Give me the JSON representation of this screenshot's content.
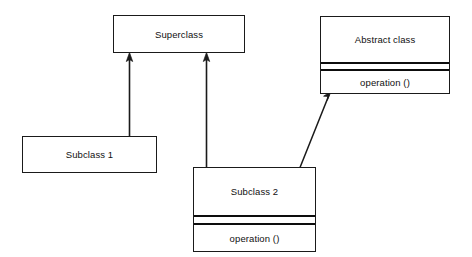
{
  "diagram": {
    "background_color": "#ffffff",
    "line_color": "#1a1a1a",
    "text_color": "#101010",
    "classes": [
      {
        "id": "superclass",
        "name": "Superclass",
        "compartments": [
          "Superclass"
        ],
        "has_attribute_compartment": false,
        "has_operation_compartment": false,
        "operations": [],
        "box": {
          "x": 113,
          "y": 15,
          "width": 132,
          "height": 38
        }
      },
      {
        "id": "abstract-class",
        "name": "Abstract class",
        "compartments": [
          "Abstract class",
          "",
          "operation ()"
        ],
        "has_attribute_compartment": true,
        "has_operation_compartment": true,
        "operations": [
          "operation ()"
        ],
        "box": {
          "x": 320,
          "y": 16,
          "width": 130,
          "height": 78
        }
      },
      {
        "id": "subclass-1",
        "name": "Subclass 1",
        "compartments": [
          "Subclass 1"
        ],
        "has_attribute_compartment": false,
        "has_operation_compartment": false,
        "operations": [],
        "box": {
          "x": 22,
          "y": 136,
          "width": 135,
          "height": 37
        }
      },
      {
        "id": "subclass-2",
        "name": "Subclass 2",
        "compartments": [
          "Subclass 2",
          "",
          "operation ()"
        ],
        "has_attribute_compartment": true,
        "has_operation_compartment": true,
        "operations": [
          "operation ()"
        ],
        "box": {
          "x": 193,
          "y": 167,
          "width": 123,
          "height": 85
        }
      }
    ],
    "relationships": [
      {
        "id": "subclass1-to-superclass",
        "type": "generalization",
        "from": "Subclass 1",
        "to": "Superclass",
        "arrowhead": "open-triangle",
        "label": ""
      },
      {
        "id": "subclass2-to-superclass",
        "type": "generalization",
        "from": "Subclass 2",
        "to": "Superclass",
        "arrowhead": "open-triangle",
        "label": ""
      },
      {
        "id": "subclass2-to-abstract-class",
        "type": "generalization",
        "from": "Subclass 2",
        "to": "Abstract class",
        "arrowhead": "open-triangle",
        "label": ""
      }
    ]
  }
}
